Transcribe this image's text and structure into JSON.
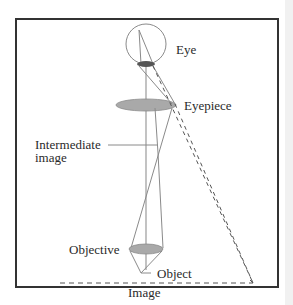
{
  "figure": {
    "title": "",
    "type": "compound microscope ray diagram",
    "labels": {
      "eye": "Eye",
      "eyepiece": "Eyepiece",
      "intermediate_image_line1": "Intermediate",
      "intermediate_image_line2": "image",
      "objective": "Objective",
      "object": "Object",
      "image": "Image"
    },
    "colors": {
      "frame": "#333333",
      "lens_fill": "#a9a9a9",
      "pupil_fill": "#555555",
      "ray": "#8a8a8a",
      "dashed_ray": "#555555",
      "text": "#2a2a2a"
    }
  }
}
